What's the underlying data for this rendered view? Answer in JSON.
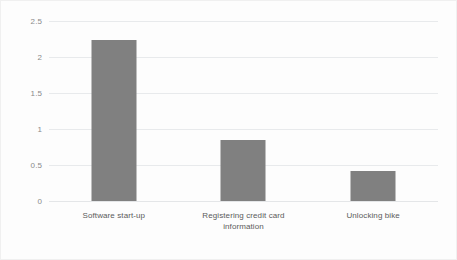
{
  "chart_data": {
    "type": "bar",
    "title": "",
    "subtitle": "",
    "xlabel": "",
    "ylabel": "",
    "categories": [
      "Software start-up",
      "Registering credit card\ninformation",
      "Unlocking bike"
    ],
    "values": [
      2.23,
      0.85,
      0.42
    ],
    "series": [
      {
        "name": "",
        "values": [
          2.23,
          0.85,
          0.42
        ]
      }
    ],
    "ylim": [
      0,
      2.5
    ],
    "yticks": [
      0,
      0.5,
      1,
      1.5,
      2,
      2.5
    ],
    "ytick_labels": [
      "0",
      "0.5",
      "1",
      "1.5",
      "2",
      "2.5"
    ],
    "grid": true,
    "grid_axis": "y",
    "legend": false,
    "legend_position": "none",
    "bar_color": "#808080",
    "grid_color": "#e8eaec",
    "tick_label_color": "#8a8a8a",
    "category_label_color": "#5b5b5b",
    "background_color": "#fdfdfd",
    "annotations": []
  }
}
